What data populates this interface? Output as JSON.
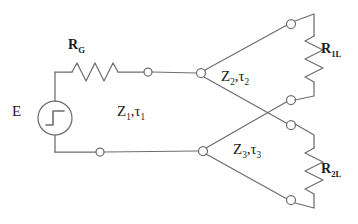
{
  "diagram": {
    "background_color": "#ffffff",
    "line_color": "#6e6e6e",
    "text_color": "#1c1c1c",
    "node_fill": "#ffffff",
    "width": 358,
    "height": 224
  },
  "components": {
    "source": {
      "label": "E",
      "symbol": "step-voltage-source",
      "description": "circle enclosing a unit-step waveform"
    },
    "series_resistor": {
      "label_main": "R",
      "label_sub": "G",
      "symbol": "resistor-zigzag-horizontal"
    },
    "line_1": {
      "label_z": "Z",
      "label_z_sub": "1",
      "label_tau": "τ",
      "label_tau_sub": "1",
      "separator": ","
    },
    "line_2": {
      "label_z": "Z",
      "label_z_sub": "2",
      "label_tau": "τ",
      "label_tau_sub": "2",
      "separator": ","
    },
    "line_3": {
      "label_z": "Z",
      "label_z_sub": "3",
      "label_tau": "τ",
      "label_tau_sub": "3",
      "separator": ","
    },
    "load_1": {
      "label_main": "R",
      "label_sub": "1L",
      "symbol": "resistor-zigzag-vertical"
    },
    "load_2": {
      "label_main": "R",
      "label_sub": "2L",
      "symbol": "resistor-zigzag-vertical"
    }
  },
  "nodes": [
    {
      "name": "node-rg-output",
      "x": 148,
      "y": 72
    },
    {
      "name": "node-bottom-return",
      "x": 100,
      "y": 152
    },
    {
      "name": "node-junction-upper",
      "x": 201,
      "y": 73
    },
    {
      "name": "node-junction-lower",
      "x": 203,
      "y": 151
    },
    {
      "name": "node-load1-top",
      "x": 291,
      "y": 24
    },
    {
      "name": "node-load1-bottom",
      "x": 291,
      "y": 100
    },
    {
      "name": "node-load2-top",
      "x": 291,
      "y": 125
    },
    {
      "name": "node-load2-bottom",
      "x": 291,
      "y": 200
    }
  ]
}
